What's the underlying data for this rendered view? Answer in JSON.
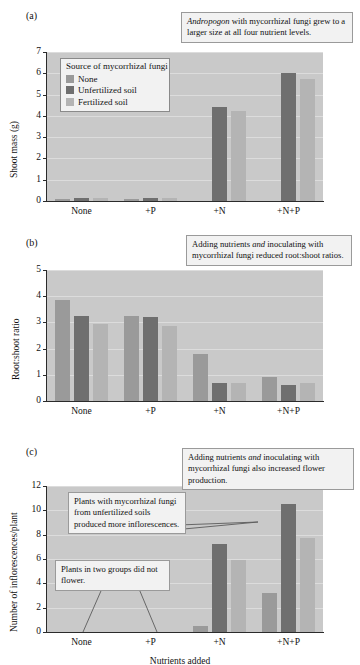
{
  "figure": {
    "xaxis_title": "Nutrients added",
    "categories": [
      "None",
      "+P",
      "+N",
      "+N+P"
    ],
    "series_names": [
      "None",
      "Unfertilized soil",
      "Fertilized soil"
    ],
    "legend_title": "Source of mycorrhizal fungi",
    "colors": {
      "none": "#9a9a9a",
      "unfertilized": "#6f6f6f",
      "fertilized": "#b4b4b4",
      "plot_background": "#c9c9c9",
      "gridline": "#dcdcdc",
      "axis": "#2b2b2b",
      "callout_background": "#f2f2f2",
      "callout_border": "#9a9a9a"
    }
  },
  "panels": {
    "a": {
      "letter": "(a)",
      "ylabel": "Shoot mass (g)",
      "yticks": [
        "0",
        "1",
        "2",
        "3",
        "4",
        "5",
        "6",
        "7"
      ],
      "callout": "Andropogon with mycorrhizal fungi grew to a larger size at all four nutrient levels.",
      "callout_italic_word": "Andropogon"
    },
    "b": {
      "letter": "(b)",
      "ylabel": "Root:shoot ratio",
      "yticks": [
        "0",
        "1",
        "2",
        "3",
        "4",
        "5"
      ],
      "callout": "Adding nutrients and inoculating with mycorrhizal fungi reduced root:shoot ratios.",
      "callout_italic_word": "and"
    },
    "c": {
      "letter": "(c)",
      "ylabel": "Number of inflorescences/plant",
      "yticks": [
        "0",
        "2",
        "4",
        "6",
        "8",
        "10",
        "12"
      ],
      "callout_main": "Adding nutrients and inoculating with mycorrhizal fungi also increased flower production.",
      "callout_main_italic_word": "and",
      "callout_unfertilized": "Plants with mycorrhizal fungi from unfertilized soils produced more inflorescences.",
      "callout_noflower": "Plants in two groups did not flower."
    }
  },
  "chart_data": [
    {
      "type": "bar",
      "panel": "a",
      "title": "",
      "xlabel": "Nutrients added",
      "ylabel": "Shoot mass (g)",
      "ylim": [
        0,
        7
      ],
      "yticks": [
        0,
        1,
        2,
        3,
        4,
        5,
        6,
        7
      ],
      "grid": true,
      "legend": "inside top-left",
      "categories": [
        "None",
        "+P",
        "+N",
        "+N+P"
      ],
      "series": [
        {
          "name": "None",
          "values": [
            0.1,
            0.1,
            0.0,
            0.0
          ]
        },
        {
          "name": "Unfertilized soil",
          "values": [
            0.15,
            0.15,
            4.4,
            6.0
          ]
        },
        {
          "name": "Fertilized soil",
          "values": [
            0.15,
            0.15,
            4.25,
            5.75
          ]
        }
      ],
      "note": "In +N and +N+P the 'None' series bars are ~0 except +N+P None which is ~2.25"
    },
    {
      "type": "bar",
      "panel": "b",
      "title": "",
      "xlabel": "Nutrients added",
      "ylabel": "Root:shoot ratio",
      "ylim": [
        0,
        5
      ],
      "yticks": [
        0,
        1,
        2,
        3,
        4,
        5
      ],
      "grid": true,
      "categories": [
        "None",
        "+P",
        "+N",
        "+N+P"
      ],
      "series": [
        {
          "name": "None",
          "values": [
            3.85,
            3.25,
            1.8,
            0.9
          ]
        },
        {
          "name": "Unfertilized soil",
          "values": [
            3.25,
            3.2,
            0.7,
            0.62
          ]
        },
        {
          "name": "Fertilized soil",
          "values": [
            2.95,
            2.85,
            0.67,
            0.68
          ]
        }
      ]
    },
    {
      "type": "bar",
      "panel": "c",
      "title": "",
      "xlabel": "Nutrients added",
      "ylabel": "Number of inflorescences/plant",
      "ylim": [
        0,
        12
      ],
      "yticks": [
        0,
        2,
        4,
        6,
        8,
        10,
        12
      ],
      "grid": true,
      "categories": [
        "None",
        "+P",
        "+N",
        "+N+P"
      ],
      "series": [
        {
          "name": "None",
          "values": [
            0,
            0,
            0.5,
            3.2
          ]
        },
        {
          "name": "Unfertilized soil",
          "values": [
            0,
            0,
            7.2,
            10.5
          ]
        },
        {
          "name": "Fertilized soil",
          "values": [
            0,
            0,
            5.95,
            7.7
          ]
        }
      ]
    }
  ]
}
